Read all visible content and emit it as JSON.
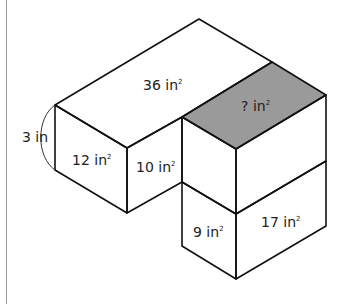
{
  "diagram": {
    "type": "isometric-composite-rectangular-prisms",
    "colors": {
      "stroke": "#111111",
      "shaded_face": "#9a9a9a",
      "background": "#ffffff",
      "page_border": "#9a9a9a"
    },
    "labels": {
      "height": "3 in",
      "top_large_face": "36 in",
      "top_unknown_face": "? in",
      "left_front_face": "12 in",
      "left_side_face": "10 in",
      "bottom_left_face": "9 in",
      "bottom_right_face": "17 in",
      "squared": "2"
    }
  }
}
